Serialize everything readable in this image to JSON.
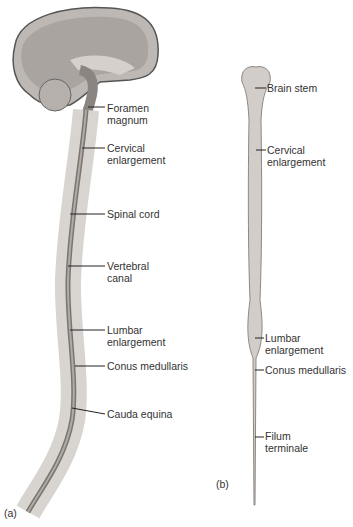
{
  "figure": {
    "panel_a": {
      "tag": "(a)",
      "labels": [
        {
          "text": "Foramen\nmagnum",
          "x": 107,
          "y": 103
        },
        {
          "text": "Cervical\nenlargement",
          "x": 107,
          "y": 143
        },
        {
          "text": "Spinal cord",
          "x": 107,
          "y": 210
        },
        {
          "text": "Vertebral\ncanal",
          "x": 107,
          "y": 262
        },
        {
          "text": "Lumbar\nenlargement",
          "x": 107,
          "y": 326
        },
        {
          "text": "Conus medullaris",
          "x": 107,
          "y": 362
        },
        {
          "text": "Cauda equina",
          "x": 107,
          "y": 410
        }
      ]
    },
    "panel_b": {
      "tag": "(b)",
      "labels": [
        {
          "text": "Brain stem",
          "x": 267,
          "y": 84
        },
        {
          "text": "Cervical\nenlargement",
          "x": 267,
          "y": 146
        },
        {
          "text": "Lumbar\nenlargement",
          "x": 265,
          "y": 334
        },
        {
          "text": "Conus medullaris",
          "x": 265,
          "y": 366
        },
        {
          "text": "Filum\nterminale",
          "x": 265,
          "y": 433
        }
      ]
    },
    "colors": {
      "tissue": "#c9c4c0",
      "line": "#222222",
      "bone": "#e6e3e0"
    }
  }
}
